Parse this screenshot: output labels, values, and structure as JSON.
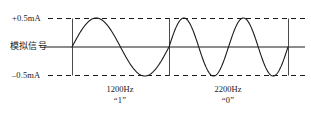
{
  "figure": {
    "width": 311,
    "height": 115,
    "background": "#ffffff",
    "line_color": "#1a1a1a"
  },
  "axis_labels": {
    "top": "+0.5mA",
    "middle": "模拟信号",
    "bottom": "–0.5mA"
  },
  "captions": [
    {
      "frequency": "1200Hz",
      "bit": "“1”"
    },
    {
      "frequency": "2200Hz",
      "bit": "“0”"
    }
  ],
  "chart_data": {
    "type": "line",
    "title": "",
    "xlabel": "",
    "ylabel": "模拟信号",
    "ylim": [
      -0.5,
      0.5
    ],
    "ytick_labels": [
      "+0.5mA",
      "–0.5mA"
    ],
    "ytick_values": [
      0.5,
      -0.5
    ],
    "grid": "dashed horizontal at +0.5mA and -0.5mA, solid zero axis",
    "legend": "none",
    "annotations": [
      {
        "text": "1200Hz",
        "sub": "“1”",
        "segment": 1
      },
      {
        "text": "2200Hz",
        "sub": "“0”",
        "segment": 2
      }
    ],
    "segments": [
      {
        "label": "1200Hz",
        "bit": "1",
        "cycles": 1,
        "amplitude_mA": 0.5,
        "x_start_px": 72,
        "x_end_px": 169
      },
      {
        "label": "2200Hz",
        "bit": "0",
        "cycles": 2,
        "amplitude_mA": 0.5,
        "x_start_px": 169,
        "x_end_px": 288
      }
    ],
    "markers_x_px": [
      72,
      169,
      288
    ],
    "zero_axis_y_px": 47,
    "top_line_y_px": 18,
    "bottom_line_y_px": 75,
    "dash_line_x_start_px": 48,
    "dash_line_x_end_px": 305,
    "zero_axis_x_start_px": 44,
    "zero_axis_x_end_px": 305
  }
}
